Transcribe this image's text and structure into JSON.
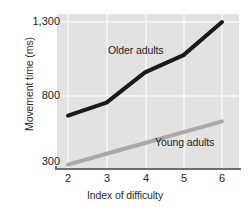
{
  "chart_data": {
    "type": "line",
    "title": "",
    "subtitle": "",
    "xlabel": "Index of difficulty",
    "ylabel": "Movement time (ms)",
    "x": [
      2,
      3,
      4,
      5,
      6
    ],
    "xticks": [
      "2",
      "3",
      "4",
      "5",
      "6"
    ],
    "yticks": [
      "300",
      "800",
      "1,300"
    ],
    "ytick_values": [
      300,
      800,
      1300
    ],
    "xlim": [
      2,
      6
    ],
    "ylim": [
      300,
      1300
    ],
    "grid": true,
    "grid_color": "#f2f2f2",
    "plot_background": "#e2e2e2",
    "legend_position": "inline-annotation",
    "series": [
      {
        "name": "Older adults",
        "color": "#1a1a1a",
        "values": [
          650,
          740,
          950,
          1070,
          1300
        ]
      },
      {
        "name": "Young adults",
        "color": "#a8a8a8",
        "values": [
          310,
          385,
          460,
          535,
          610
        ]
      }
    ]
  },
  "axes": {
    "y_title": "Movement time (ms)",
    "x_title": "Index of difficulty",
    "y_tick_labels": [
      "1,300",
      "800",
      "300"
    ],
    "x_tick_labels": [
      "2",
      "3",
      "4",
      "5",
      "6"
    ]
  },
  "annotations": {
    "older_label": "Older adults",
    "young_label": "Young adults"
  },
  "colors": {
    "older_line": "#1a1a1a",
    "young_line": "#a8a8a8",
    "plot_bg": "#e2e2e2",
    "gridline": "#f2f2f2",
    "axis": "#6e6e6e",
    "text": "#1d1d1d"
  }
}
